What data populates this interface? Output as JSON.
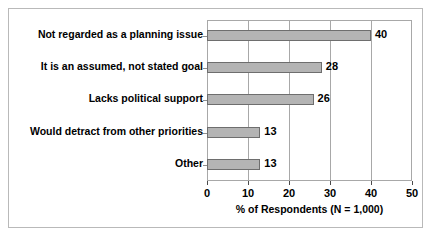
{
  "chart_data": {
    "type": "bar",
    "orientation": "horizontal",
    "title": "",
    "xlabel": "% of Respondents (N = 1,000)",
    "ylabel": "",
    "xlim": [
      0,
      50
    ],
    "xticks": [
      0,
      10,
      20,
      30,
      40,
      50
    ],
    "grid": true,
    "legend": false,
    "bar_color": "#b4b4b4",
    "bar_edge_color": "#6e6e6e",
    "categories": [
      "Not regarded as a planning issue",
      "It is an assumed, not stated goal",
      "Lacks political support",
      "Would detract from other priorities",
      "Other"
    ],
    "values": [
      40,
      28,
      26,
      13,
      13
    ],
    "value_labels": [
      "40",
      "28",
      "26",
      "13",
      "13"
    ],
    "xtick_labels": [
      "0",
      "10",
      "20",
      "30",
      "40",
      "50"
    ]
  }
}
